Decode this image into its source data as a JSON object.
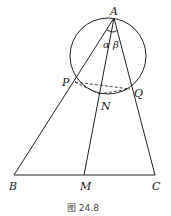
{
  "figure": {
    "caption": "图 24.8",
    "points": {
      "A": "A",
      "P": "P",
      "Q": "Q",
      "N": "N",
      "B": "B",
      "M": "M",
      "C": "C"
    },
    "angles": {
      "alpha": "α",
      "beta": "β"
    },
    "segments_solid": [
      "AB",
      "AC",
      "AM",
      "BC"
    ],
    "segments_dashed": [
      "PQ",
      "PN",
      "NQ"
    ],
    "circle": "circle through A, P, N, Q"
  }
}
